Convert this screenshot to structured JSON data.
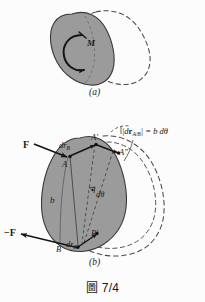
{
  "figure": {
    "caption_symbol": "圖",
    "caption_number": "7/4",
    "panels": [
      {
        "id": "a",
        "label": "(a)"
      },
      {
        "id": "b",
        "label": "(b)"
      }
    ]
  },
  "panel_a": {
    "couple_label": "M",
    "sublabel": "(a)",
    "body_fill": "#9b9b9b",
    "body_stroke": "#3a3a3a",
    "ghost_stroke": "#4a4a4a"
  },
  "panel_b": {
    "sublabel": "(b)",
    "force_label": "F",
    "force_label_negative": "−F",
    "displacement_top": "dr",
    "displacement_top_sub": "B",
    "displacement_bottom": "dr",
    "displacement_bottom_sub": "B",
    "point_a": "A",
    "point_a_prime": "A′",
    "point_a_double_prime": "A″",
    "point_b": "B",
    "point_b_prime": "B′",
    "distance_label": "b",
    "angle_label": "dθ",
    "equation": "|dr_A/B| = b dθ",
    "equation_lhs_bar": "|",
    "equation_d": "d",
    "equation_r": "r",
    "equation_sub": "A/B",
    "equation_rhs": "= b dθ",
    "body_fill": "#9b9b9b",
    "body_stroke": "#3a3a3a",
    "ghost_stroke": "#4a4a4a"
  },
  "colors": {
    "background": "#fcfcfc",
    "body_gray": "#9b9b9b",
    "outline": "#3a3a3a",
    "ink": "#1b1b1b",
    "dashed": "#4a4a4a"
  }
}
